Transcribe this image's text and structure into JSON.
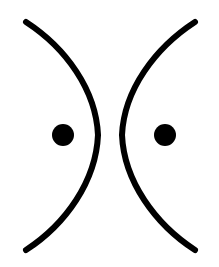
{
  "canvas": {
    "width": 219,
    "height": 267,
    "background_color": "#ffffff",
    "ink_color": "#000000",
    "description": "Two mirrored black arcs bowing away from each other with a filled black dot inside each arc"
  },
  "figure": {
    "title": "",
    "shapes": [
      {
        "name": "left-arc",
        "type": "arc",
        "role": "left bracket curve opening to the left, bulging rightward",
        "color": "#000000",
        "stroke_width": 6,
        "stroke_width_tip": 4,
        "start_point": [
          26,
          22
        ],
        "end_point": [
          26,
          250
        ],
        "apex_point": [
          99,
          135
        ],
        "path": "M 26 22 C 66 48, 96 90, 98 135 C 96 181, 66 224, 26 250"
      },
      {
        "name": "right-arc",
        "type": "arc",
        "role": "right bracket curve opening to the right, bulging leftward",
        "color": "#000000",
        "stroke_width": 6,
        "stroke_width_tip": 4,
        "start_point": [
          195,
          22
        ],
        "end_point": [
          195,
          250
        ],
        "apex_point": [
          120,
          135
        ],
        "path": "M 195 22 C 155 48, 124 90, 122 135 C 124 181, 155 224, 195 250"
      },
      {
        "name": "left-dot",
        "type": "circle",
        "role": "filled dot inside left arc",
        "color": "#000000",
        "center": [
          63,
          135
        ],
        "radius": 11
      },
      {
        "name": "right-dot",
        "type": "circle",
        "role": "filled dot inside right arc",
        "color": "#000000",
        "center": [
          165,
          135
        ],
        "radius": 11
      }
    ],
    "gap": {
      "name": "central-gap",
      "left_edge_x": 101,
      "right_edge_x": 119,
      "center_x": 110,
      "width": 18
    }
  }
}
